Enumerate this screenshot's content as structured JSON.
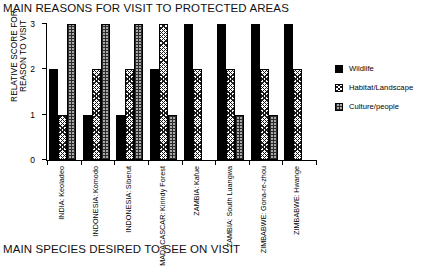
{
  "chart_data": {
    "type": "bar",
    "title": "MAIN REASONS FOR VISIT TO PROTECTED AREAS",
    "xlabel": "",
    "ylabel": "RELATIVE SCORE FOR REASON TO VISIT",
    "ylabel_lines": [
      "RELATIVE SCORE FOR",
      "REASON TO VISIT"
    ],
    "ylim": [
      0,
      3
    ],
    "yticks": [
      0,
      1,
      2,
      3
    ],
    "ytick_labels": [
      "0",
      "1",
      "2",
      "3"
    ],
    "grid": false,
    "legend_position": "right",
    "categories": [
      "INDIA: Keoladeo",
      "INDONESIA: Komodo",
      "INDONESIA: Siberut",
      "MADAGASCAR: Kirindy Forest",
      "ZAMBIA: Kafue",
      "ZAMBIA: South Luangwa",
      "ZIMBABWE: Gona-re-zhou",
      "ZIMBABWE: Hwange"
    ],
    "category_lines": [
      {
        "l1": "INDIA:",
        "l2": "Keoladeo"
      },
      {
        "l1": "INDONESIA:",
        "l2": "Komodo"
      },
      {
        "l1": "INDONESIA:",
        "l2": "Siberut"
      },
      {
        "l1": "MADACASCAR:",
        "l2": "Kirindy Forest"
      },
      {
        "l1": "ZAMBIA:",
        "l2": "Kafue"
      },
      {
        "l1": "ZAMBIA:",
        "l2": "South Luangwa"
      },
      {
        "l1": "ZIMBABWE:",
        "l2": "Gona-re-zhou"
      },
      {
        "l1": "ZIMBABWE:",
        "l2": "Hwange"
      }
    ],
    "series": [
      {
        "name": "Wildlife",
        "fill": "solid-black",
        "color": "#000000",
        "values": [
          2,
          1,
          1,
          2,
          3,
          3,
          3,
          3
        ]
      },
      {
        "name": "Habitat/Landscape",
        "fill": "diagonal-hatch",
        "color": "#1a1a1a",
        "values": [
          1,
          2,
          2,
          3,
          2,
          2,
          2,
          2
        ]
      },
      {
        "name": "Culture/people",
        "fill": "grid-hatch",
        "color": "#a9a9a9",
        "values": [
          3,
          3,
          3,
          1,
          0,
          1,
          1,
          0
        ]
      }
    ]
  },
  "bottom_caption": "MAIN SPECIES DESIRED TO SEE ON VISIT"
}
